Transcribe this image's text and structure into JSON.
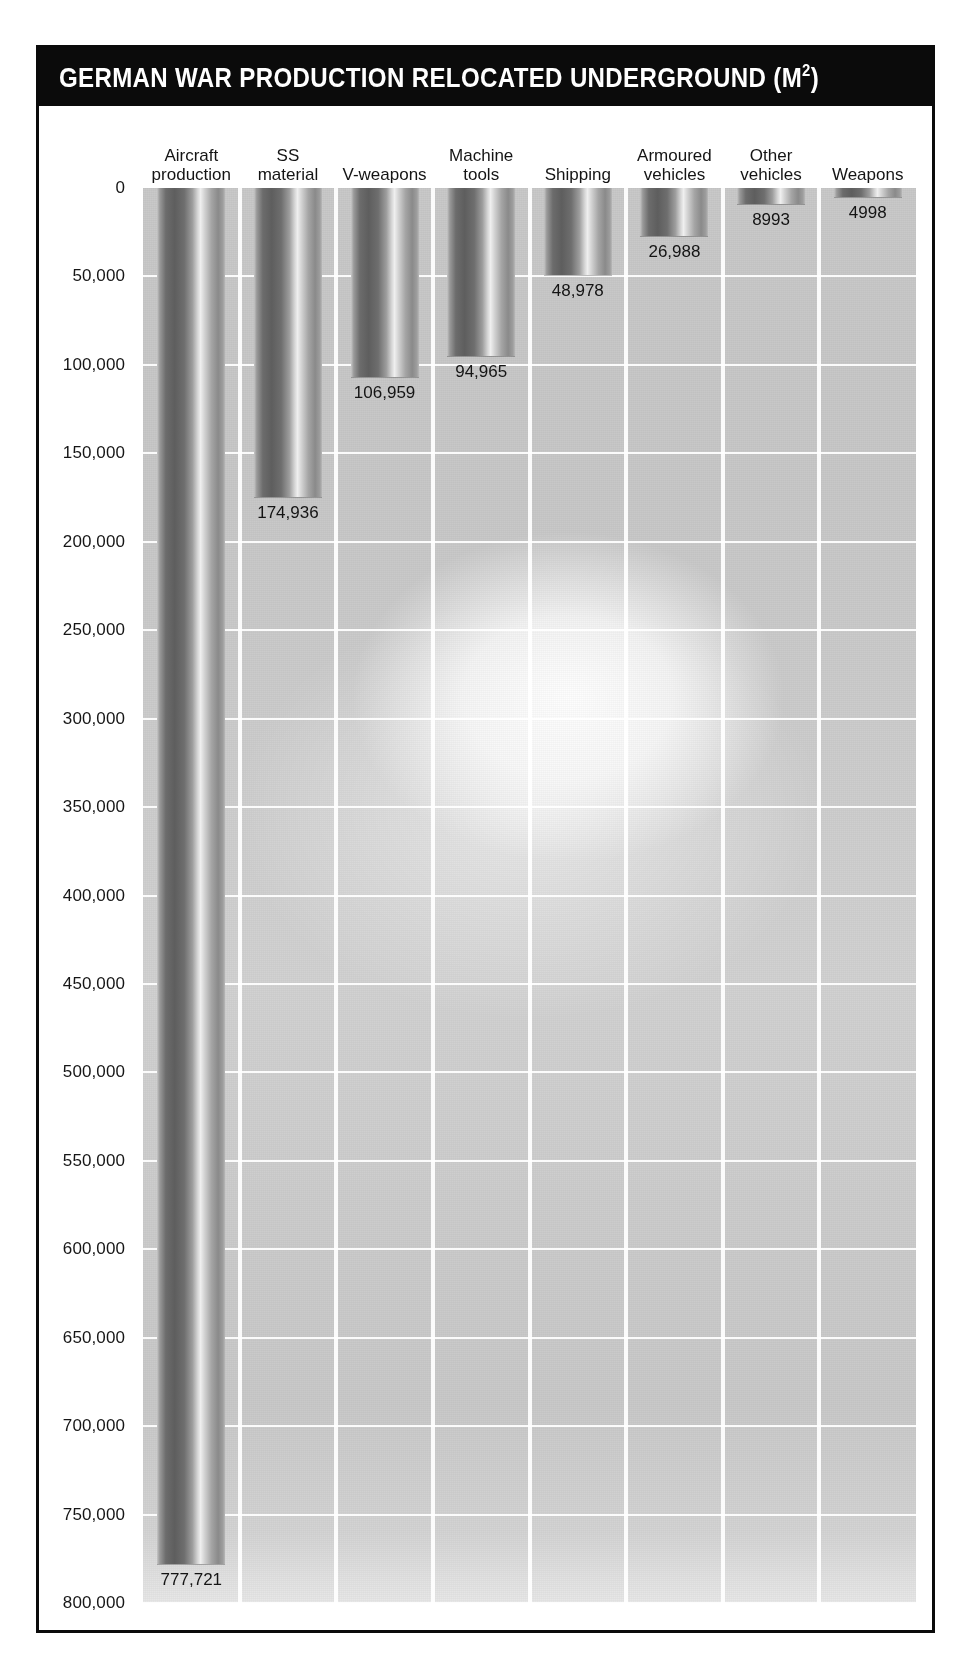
{
  "title": {
    "main": "GERMAN WAR PRODUCTION RELOCATED UNDERGROUND (M",
    "superscript": "2",
    "suffix": ")",
    "full": "GERMAN WAR PRODUCTION RELOCATED UNDERGROUND (M2)"
  },
  "chart_data": {
    "type": "bar",
    "title": "GERMAN WAR PRODUCTION RELOCATED UNDERGROUND (M2)",
    "subtitle": "",
    "xlabel": "",
    "ylabel": "",
    "orientation": "vertical-inverted",
    "axis_inverted": true,
    "ylim": [
      0,
      800000
    ],
    "grid": true,
    "grid_color": "#ffffff",
    "legend": "none",
    "categories": [
      "Aircraft\nproduction",
      "SS\nmaterial",
      "V-weapons",
      "Machine\ntools",
      "Shipping",
      "Armoured\nvehicles",
      "Other\nvehicles",
      "Weapons"
    ],
    "values": [
      777721,
      174936,
      106959,
      94965,
      48978,
      26988,
      8993,
      4998
    ],
    "value_labels": [
      "777,721",
      "174,936",
      "106,959",
      "94,965",
      "48,978",
      "26,988",
      "8993",
      "4998"
    ],
    "ticks": [
      0,
      50000,
      100000,
      150000,
      200000,
      250000,
      300000,
      350000,
      400000,
      450000,
      500000,
      550000,
      600000,
      650000,
      700000,
      750000,
      800000
    ],
    "tick_labels": [
      "0",
      "50,000",
      "100,000",
      "150,000",
      "200,000",
      "250,000",
      "300,000",
      "350,000",
      "400,000",
      "450,000",
      "500,000",
      "550,000",
      "600,000",
      "650,000",
      "700,000",
      "750,000",
      "800,000"
    ]
  },
  "colors": {
    "banner_background": "#0b0b0b",
    "banner_text": "#ffffff",
    "frame_border": "#0a0a0a",
    "plot_background": "#cccccc",
    "gridline": "#ffffff",
    "bar_light": "#efefef",
    "bar_dark": "#5e5e5e",
    "text": "#141414",
    "page_background": "#ffffff"
  }
}
